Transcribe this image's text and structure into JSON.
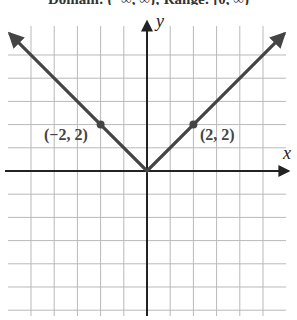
{
  "caption": "Domain: (−∞, ∞); Range: [0, ∞)",
  "chart_data": {
    "type": "line",
    "title": "",
    "function": "y = |x|",
    "xlabel": "x",
    "ylabel": "y",
    "xlim": [
      -6,
      6
    ],
    "ylim": [
      -6,
      6
    ],
    "grid": true,
    "grid_step": 1,
    "series": [
      {
        "name": "y = |x|",
        "x": [
          -6,
          -2,
          0,
          2,
          6
        ],
        "y": [
          6,
          2,
          0,
          2,
          6
        ],
        "color": "#444444",
        "arrows": "both-ends"
      }
    ],
    "points": [
      {
        "x": -2,
        "y": 2,
        "label": "(−2, 2)"
      },
      {
        "x": 2,
        "y": 2,
        "label": "(2, 2)"
      }
    ],
    "annotations": [
      "(−2, 2)",
      "(2, 2)"
    ],
    "legend": null
  },
  "labels": {
    "x_axis": "x",
    "y_axis": "y",
    "point_left": "(−2, 2)",
    "point_right": "(2, 2)"
  }
}
